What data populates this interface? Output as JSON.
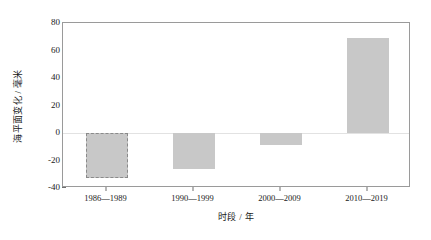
{
  "chart_data": {
    "type": "bar",
    "title": "",
    "xlabel": "时段 / 年",
    "ylabel": "海平面变化 / 毫米",
    "categories": [
      "1986—1989",
      "1990—1999",
      "2000—2009",
      "2010—2019"
    ],
    "values": [
      -33,
      -26,
      -9,
      69
    ],
    "ylim": [
      -40,
      80
    ],
    "yticks": [
      80,
      60,
      40,
      20,
      0,
      -20,
      -40
    ],
    "ytick_labels": [
      "80",
      "60",
      "40",
      "20",
      "0",
      "-20",
      "-40"
    ],
    "grid": false,
    "legend": null,
    "bar_color": "#c8c8c8",
    "bar_edge_color": "#8a8a8a",
    "highlighted_index": 0,
    "highlight_style": "dashed-border",
    "series": [
      {
        "name": "海平面变化",
        "values": [
          -33,
          -26,
          -9,
          69
        ]
      }
    ]
  }
}
